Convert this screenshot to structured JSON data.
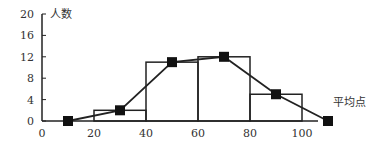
{
  "chart_data": {
    "type": "bar",
    "title": "",
    "xlabel": "平均点",
    "ylabel": "人数",
    "x_ticks": [
      0,
      20,
      40,
      60,
      80,
      100
    ],
    "y_ticks": [
      0,
      4,
      8,
      12,
      16,
      20
    ],
    "xlim": [
      0,
      120
    ],
    "ylim": [
      0,
      20
    ],
    "grid": false,
    "legend": "none",
    "histogram": {
      "bins": [
        [
          20,
          40
        ],
        [
          40,
          60
        ],
        [
          60,
          80
        ],
        [
          80,
          100
        ]
      ],
      "values": [
        2,
        11,
        12,
        5
      ]
    },
    "frequency_polygon": {
      "x": [
        10,
        30,
        50,
        70,
        90,
        110
      ],
      "y": [
        0,
        2,
        11,
        12,
        5,
        0
      ]
    }
  }
}
